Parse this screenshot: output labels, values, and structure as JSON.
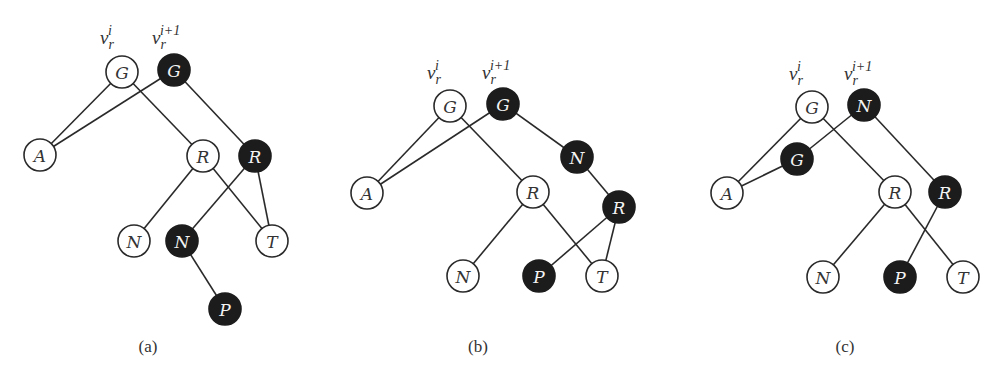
{
  "figure": {
    "node_radius": 16,
    "colors": {
      "dark_fill": "#1c1c1c",
      "light_fill": "#ffffff",
      "stroke": "#2a2a2a",
      "dark_text": "#f4f4f4",
      "light_text": "#333333"
    },
    "panels": [
      {
        "id": "a",
        "caption": "(a)",
        "caption_pos": [
          148,
          352
        ],
        "labels": [
          {
            "base": "v",
            "sub": "r",
            "sup": "i",
            "pos": [
              100,
              44
            ]
          },
          {
            "base": "v",
            "sub": "r",
            "sup": "i+1",
            "pos": [
              152,
              44
            ]
          }
        ],
        "nodes": [
          {
            "id": "Gw",
            "label": "G",
            "x": 122,
            "y": 72,
            "dark": false
          },
          {
            "id": "Gd",
            "label": "G",
            "x": 174,
            "y": 70,
            "dark": true
          },
          {
            "id": "A",
            "label": "A",
            "x": 40,
            "y": 155,
            "dark": false
          },
          {
            "id": "Rw",
            "label": "R",
            "x": 203,
            "y": 156,
            "dark": false
          },
          {
            "id": "Rd",
            "label": "R",
            "x": 255,
            "y": 156,
            "dark": true
          },
          {
            "id": "Nw",
            "label": "N",
            "x": 134,
            "y": 241,
            "dark": false
          },
          {
            "id": "Nd",
            "label": "N",
            "x": 182,
            "y": 241,
            "dark": true
          },
          {
            "id": "T",
            "label": "T",
            "x": 272,
            "y": 241,
            "dark": false
          },
          {
            "id": "Pd",
            "label": "P",
            "x": 225,
            "y": 309,
            "dark": true
          }
        ],
        "edges": [
          [
            "Gw",
            "A"
          ],
          [
            "Gw",
            "Rw"
          ],
          [
            "Gd",
            "A"
          ],
          [
            "Gd",
            "Rd"
          ],
          [
            "Rw",
            "Nw"
          ],
          [
            "Rw",
            "T"
          ],
          [
            "Rd",
            "Nd"
          ],
          [
            "Rd",
            "T"
          ],
          [
            "Nd",
            "Pd"
          ]
        ]
      },
      {
        "id": "b",
        "caption": "(b)",
        "caption_pos": [
          478,
          352
        ],
        "labels": [
          {
            "base": "v",
            "sub": "r",
            "sup": "i",
            "pos": [
              427,
              79
            ]
          },
          {
            "base": "v",
            "sub": "r",
            "sup": "i+1",
            "pos": [
              482,
              79
            ]
          }
        ],
        "nodes": [
          {
            "id": "Gw",
            "label": "G",
            "x": 450,
            "y": 106,
            "dark": false
          },
          {
            "id": "Gd",
            "label": "G",
            "x": 503,
            "y": 104,
            "dark": true
          },
          {
            "id": "Nd",
            "label": "N",
            "x": 577,
            "y": 157,
            "dark": true
          },
          {
            "id": "A",
            "label": "A",
            "x": 367,
            "y": 193,
            "dark": false
          },
          {
            "id": "Rw",
            "label": "R",
            "x": 533,
            "y": 192,
            "dark": false
          },
          {
            "id": "Rd",
            "label": "R",
            "x": 619,
            "y": 207,
            "dark": true
          },
          {
            "id": "Nw",
            "label": "N",
            "x": 463,
            "y": 276,
            "dark": false
          },
          {
            "id": "Pd",
            "label": "P",
            "x": 539,
            "y": 276,
            "dark": true
          },
          {
            "id": "T",
            "label": "T",
            "x": 602,
            "y": 276,
            "dark": false
          }
        ],
        "edges": [
          [
            "Gw",
            "A"
          ],
          [
            "Gw",
            "Rw"
          ],
          [
            "Gd",
            "A"
          ],
          [
            "Gd",
            "Nd"
          ],
          [
            "Nd",
            "Rd"
          ],
          [
            "Rw",
            "Nw"
          ],
          [
            "Rw",
            "T"
          ],
          [
            "Rd",
            "Pd"
          ],
          [
            "Rd",
            "T"
          ]
        ]
      },
      {
        "id": "c",
        "caption": "(c)",
        "caption_pos": [
          845,
          352
        ],
        "labels": [
          {
            "base": "v",
            "sub": "r",
            "sup": "i",
            "pos": [
              789,
              80
            ]
          },
          {
            "base": "v",
            "sub": "r",
            "sup": "i+1",
            "pos": [
              844,
              80
            ]
          }
        ],
        "nodes": [
          {
            "id": "Gw",
            "label": "G",
            "x": 812,
            "y": 107,
            "dark": false
          },
          {
            "id": "Nd",
            "label": "N",
            "x": 864,
            "y": 105,
            "dark": true
          },
          {
            "id": "Gd",
            "label": "G",
            "x": 797,
            "y": 159,
            "dark": true
          },
          {
            "id": "A",
            "label": "A",
            "x": 727,
            "y": 193,
            "dark": false
          },
          {
            "id": "Rw",
            "label": "R",
            "x": 895,
            "y": 192,
            "dark": false
          },
          {
            "id": "Rd",
            "label": "R",
            "x": 945,
            "y": 192,
            "dark": true
          },
          {
            "id": "Nw",
            "label": "N",
            "x": 823,
            "y": 277,
            "dark": false
          },
          {
            "id": "Pd",
            "label": "P",
            "x": 900,
            "y": 277,
            "dark": true
          },
          {
            "id": "T",
            "label": "T",
            "x": 963,
            "y": 277,
            "dark": false
          }
        ],
        "edges": [
          [
            "Gw",
            "A"
          ],
          [
            "Gw",
            "Rw"
          ],
          [
            "Nd",
            "Gd"
          ],
          [
            "Nd",
            "Rd"
          ],
          [
            "Gd",
            "A"
          ],
          [
            "Rw",
            "Nw"
          ],
          [
            "Rw",
            "T"
          ],
          [
            "Rd",
            "Pd"
          ]
        ]
      }
    ]
  }
}
